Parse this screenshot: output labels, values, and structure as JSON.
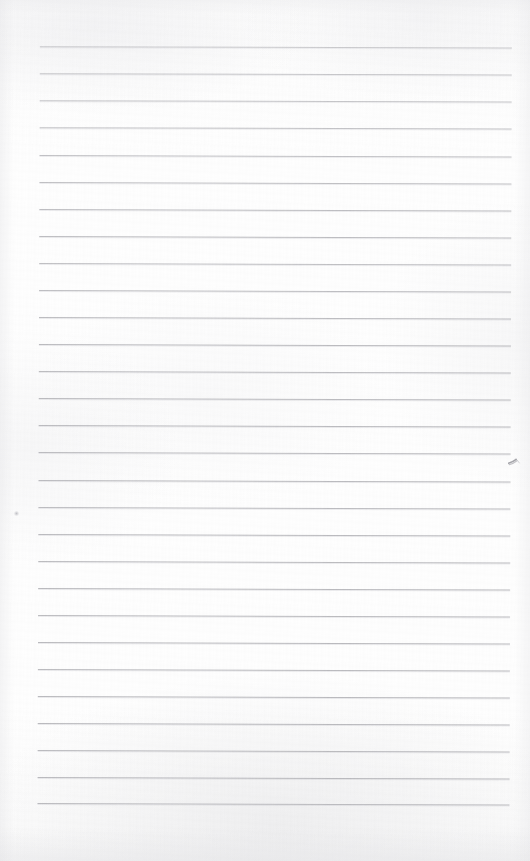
{
  "document": {
    "type": "scanned-lined-notepad-page",
    "title": "Blank Ruled Notepad Page",
    "content_text": "",
    "page_width": 530,
    "page_height": 861,
    "paper_color": "#fdfdfd",
    "rule_color": "#b9b9bd",
    "rule_count": 29,
    "rule_left_x": 40,
    "rule_right_x": 512,
    "rule_first_y": 46,
    "rule_spacing": 27.05,
    "skew_degrees": 0.18,
    "rules": [
      {
        "index": 1,
        "y": 46,
        "opacity": 0.72
      },
      {
        "index": 2,
        "y": 73,
        "opacity": 0.78
      },
      {
        "index": 3,
        "y": 100,
        "opacity": 0.8
      },
      {
        "index": 4,
        "y": 127,
        "opacity": 0.84
      },
      {
        "index": 5,
        "y": 155,
        "opacity": 0.86
      },
      {
        "index": 6,
        "y": 182,
        "opacity": 0.88
      },
      {
        "index": 7,
        "y": 209,
        "opacity": 0.9
      },
      {
        "index": 8,
        "y": 236,
        "opacity": 0.92
      },
      {
        "index": 9,
        "y": 263,
        "opacity": 0.88
      },
      {
        "index": 10,
        "y": 290,
        "opacity": 0.9
      },
      {
        "index": 11,
        "y": 317,
        "opacity": 0.92
      },
      {
        "index": 12,
        "y": 344,
        "opacity": 0.94
      },
      {
        "index": 13,
        "y": 371,
        "opacity": 0.92
      },
      {
        "index": 14,
        "y": 398,
        "opacity": 0.94
      },
      {
        "index": 15,
        "y": 425,
        "opacity": 0.95
      },
      {
        "index": 16,
        "y": 452,
        "opacity": 0.93
      },
      {
        "index": 17,
        "y": 480,
        "opacity": 0.95
      },
      {
        "index": 18,
        "y": 507,
        "opacity": 0.93
      },
      {
        "index": 19,
        "y": 534,
        "opacity": 0.95
      },
      {
        "index": 20,
        "y": 561,
        "opacity": 0.94
      },
      {
        "index": 21,
        "y": 588,
        "opacity": 0.96
      },
      {
        "index": 22,
        "y": 615,
        "opacity": 0.94
      },
      {
        "index": 23,
        "y": 642,
        "opacity": 0.96
      },
      {
        "index": 24,
        "y": 669,
        "opacity": 0.95
      },
      {
        "index": 25,
        "y": 696,
        "opacity": 0.96
      },
      {
        "index": 26,
        "y": 723,
        "opacity": 0.96
      },
      {
        "index": 27,
        "y": 750,
        "opacity": 0.95
      },
      {
        "index": 28,
        "y": 777,
        "opacity": 0.96
      },
      {
        "index": 29,
        "y": 803,
        "opacity": 0.94
      }
    ],
    "ink_marks": [
      {
        "name": "check-mark-smudge",
        "x": 508,
        "y": 458,
        "width": 14,
        "height": 10,
        "color": "#8d8d93"
      },
      {
        "name": "faint-dot",
        "x": 14,
        "y": 511,
        "width": 5,
        "height": 5,
        "color": "#b2b2b8"
      }
    ]
  }
}
